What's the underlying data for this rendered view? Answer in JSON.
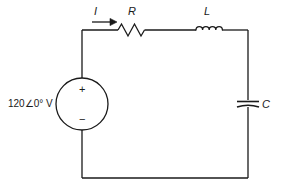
{
  "figure": {
    "name": "series-rlc-ac-circuit",
    "type": "schematic",
    "background_color": "#ffffff",
    "stroke_color": "#1a1a1a"
  },
  "labels": {
    "source_value": "120∠0° V",
    "current": "I",
    "resistor": "R",
    "inductor": "L",
    "capacitor": "C",
    "polarity_plus": "+",
    "polarity_minus": "−"
  },
  "components": [
    {
      "id": "voltage-source",
      "symbol": "ac-voltage-source-circle",
      "label": "120∠0° V",
      "side": "left"
    },
    {
      "id": "resistor",
      "symbol": "resistor-zigzag",
      "label": "R",
      "side": "top"
    },
    {
      "id": "inductor",
      "symbol": "inductor-coil",
      "label": "L",
      "side": "top"
    },
    {
      "id": "capacitor",
      "symbol": "capacitor-plates",
      "label": "C",
      "side": "right"
    }
  ],
  "annotations": {
    "current_arrow_direction": "right"
  }
}
